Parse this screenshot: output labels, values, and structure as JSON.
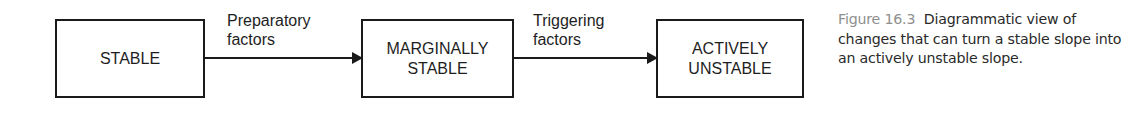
{
  "diagram": {
    "boxes": [
      {
        "id": "stable",
        "lines": [
          "STABLE"
        ]
      },
      {
        "id": "marginally-stable",
        "lines": [
          "MARGINALLY",
          "STABLE"
        ]
      },
      {
        "id": "actively-unstable",
        "lines": [
          "ACTIVELY",
          "UNSTABLE"
        ]
      }
    ],
    "arrows": [
      {
        "from": "stable",
        "to": "marginally-stable",
        "label_lines": [
          "Preparatory",
          "factors"
        ]
      },
      {
        "from": "marginally-stable",
        "to": "actively-unstable",
        "label_lines": [
          "Triggering",
          "factors"
        ]
      }
    ],
    "colors": {
      "stroke": "#1a1a1a",
      "text": "#1e1e1e",
      "caption_label": "#8f8f8f"
    }
  },
  "caption": {
    "label": "Figure 16.3",
    "text": "Diagrammatic view of changes that can turn a stable slope into an actively unstable slope."
  }
}
